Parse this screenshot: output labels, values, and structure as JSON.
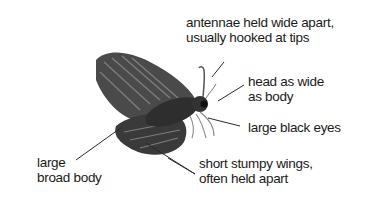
{
  "diagram": {
    "labels": {
      "antennae": {
        "line1": "antennae held wide apart,",
        "line2": "usually hooked at tips"
      },
      "head": {
        "line1": "head as wide",
        "line2": "as body"
      },
      "eyes": {
        "line1": "large black eyes"
      },
      "body": {
        "line1": "large",
        "line2": "broad body"
      },
      "wings": {
        "line1": "short stumpy wings,",
        "line2": "often held apart"
      }
    },
    "colors": {
      "background": "#ffffff",
      "text": "#1a1a1a",
      "leader": "#2a2a2a",
      "wing_dark": "#3a3a3a",
      "wing_mid": "#6a6a6a",
      "wing_light": "#a8a8a8"
    }
  }
}
